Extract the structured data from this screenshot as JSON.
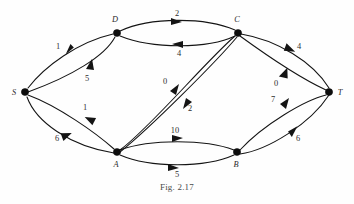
{
  "figure": {
    "caption": "Fig. 2.17",
    "kind": "directed-weighted-graph",
    "background_color": "#fefefe",
    "stroke_color": "#141414"
  },
  "graph": {
    "nodes": [
      {
        "id": "S",
        "label": "S",
        "x": 25,
        "y": 92,
        "label_x": 14,
        "label_y": 95
      },
      {
        "id": "D",
        "label": "D",
        "x": 117,
        "y": 33,
        "label_x": 114,
        "label_y": 22
      },
      {
        "id": "C",
        "label": "C",
        "x": 238,
        "y": 33,
        "label_x": 236,
        "label_y": 22
      },
      {
        "id": "T",
        "label": "T",
        "x": 329,
        "y": 92,
        "label_x": 340,
        "label_y": 95
      },
      {
        "id": "A",
        "label": "A",
        "x": 117,
        "y": 152,
        "label_x": 114,
        "label_y": 166
      },
      {
        "id": "B",
        "label": "B",
        "x": 237,
        "y": 152,
        "label_x": 234,
        "label_y": 166
      }
    ],
    "edges": [
      {
        "from": "S",
        "to": "D",
        "weight": "1",
        "label_x": 58,
        "label_y": 49
      },
      {
        "from": "D",
        "to": "S",
        "weight": "5",
        "label_x": 87,
        "label_y": 81
      },
      {
        "from": "D",
        "to": "C",
        "weight": "2",
        "label_x": 177,
        "label_y": 16
      },
      {
        "from": "C",
        "to": "D",
        "weight": "4",
        "label_x": 179,
        "label_y": 55
      },
      {
        "from": "C",
        "to": "T",
        "weight": "4",
        "label_x": 298,
        "label_y": 49
      },
      {
        "from": "T",
        "to": "C",
        "weight": "0",
        "label_x": 276,
        "label_y": 85
      },
      {
        "from": "A",
        "to": "C",
        "weight": "0",
        "label_x": 165,
        "label_y": 83
      },
      {
        "from": "C",
        "to": "A",
        "weight": "2",
        "label_x": 189,
        "label_y": 110
      },
      {
        "from": "A",
        "to": "S",
        "weight": "1",
        "label_x": 85,
        "label_y": 110
      },
      {
        "from": "S",
        "to": "A",
        "weight": "6",
        "label_x": 57,
        "label_y": 140
      },
      {
        "from": "B",
        "to": "A",
        "weight": "10",
        "label_x": 174,
        "label_y": 133
      },
      {
        "from": "A",
        "to": "B",
        "weight": "5",
        "label_x": 177,
        "label_y": 176
      },
      {
        "from": "T",
        "to": "B",
        "weight": "7",
        "label_x": 273,
        "label_y": 102
      },
      {
        "from": "B",
        "to": "T",
        "weight": "6",
        "label_x": 297,
        "label_y": 140
      }
    ]
  }
}
